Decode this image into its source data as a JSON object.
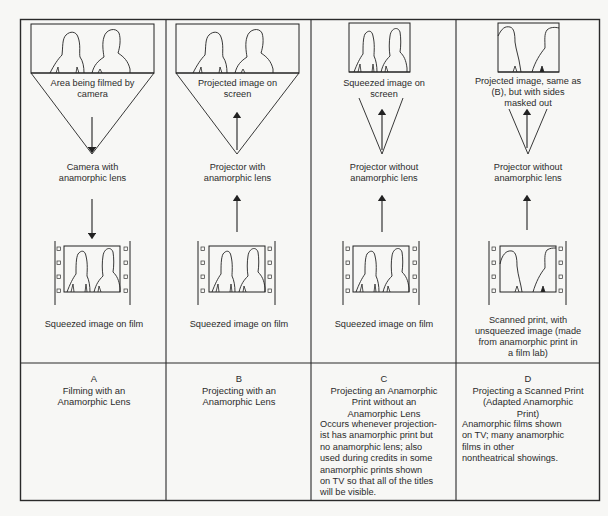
{
  "panels": [
    {
      "letter": "A",
      "screen_label": "Area being filmed by camera",
      "device_label": "Camera with anamorphic lens",
      "film_label": "Squeezed image on film",
      "title": "Filming with an Anamorphic Lens",
      "description": "",
      "arrow_direction": "down"
    },
    {
      "letter": "B",
      "screen_label": "Projected image on screen",
      "device_label": "Projector with anamorphic lens",
      "film_label": "Squeezed image on film",
      "title": "Projecting with an Anamorphic Lens",
      "description": "",
      "arrow_direction": "up"
    },
    {
      "letter": "C",
      "screen_label": "Squeezed image on screen",
      "device_label": "Projector without anamorphic lens",
      "film_label": "Squeezed image on film",
      "title": "Projecting an Anamorphic Print without an Anamorphic Lens",
      "description": "Occurs whenever projectionist has anamorphic print but no anamorphic lens; also used during credits in some anamorphic prints shown on TV so that all of the titles will be visible.",
      "arrow_direction": "up"
    },
    {
      "letter": "D",
      "screen_label": "Projected image, same as (B), but with sides masked out",
      "device_label": "Projector without anamorphic lens",
      "film_label": "Scanned print, with unsqueezed image (made from anamorphic print in a film lab)",
      "title": "Projecting a Scanned Print (Adapted Anamorphic Print)",
      "description": "Anamorphic films shown on TV; many anamorphic films in other nontheatrical showings.",
      "arrow_direction": "up"
    }
  ],
  "lines": {
    "A_screen": [
      "Area being filmed by",
      "camera"
    ],
    "A_device": [
      "Camera with",
      "anamorphic lens"
    ],
    "A_title": [
      "Filming with an",
      "Anamorphic Lens"
    ],
    "B_screen": [
      "Projected image on",
      "screen"
    ],
    "B_device": [
      "Projector with",
      "anamorphic lens"
    ],
    "B_title": [
      "Projecting with an",
      "Anamorphic Lens"
    ],
    "C_screen": [
      "Squeezed image on",
      "screen"
    ],
    "C_device": [
      "Projector without",
      "anamorphic lens"
    ],
    "C_title": [
      "Projecting an Anamorphic",
      "Print without an",
      "Anamorphic Lens"
    ],
    "C_desc": [
      "Occurs whenever projection-",
      "ist has anamorphic print but",
      "no anamorphic lens; also",
      "used during credits in some",
      "anamorphic prints shown",
      "on TV so that all of the titles",
      "will be visible."
    ],
    "D_screen": [
      "Projected image, same as",
      "(B), but with sides",
      "masked out"
    ],
    "D_device": [
      "Projector without",
      "anamorphic lens"
    ],
    "D_film": [
      "Scanned print, with",
      "unsqueezed image (made",
      "from anamorphic print in",
      "a film lab)"
    ],
    "D_title": [
      "Projecting a Scanned Print",
      "(Adapted Anamorphic",
      "Print)"
    ],
    "D_desc": [
      "Anamorphic films  shown",
      "on TV; many anamorphic",
      "films in other",
      "nontheatrical showings."
    ]
  },
  "colors": {
    "paper": "#f7f7f5",
    "ink": "#2a2a2a"
  }
}
